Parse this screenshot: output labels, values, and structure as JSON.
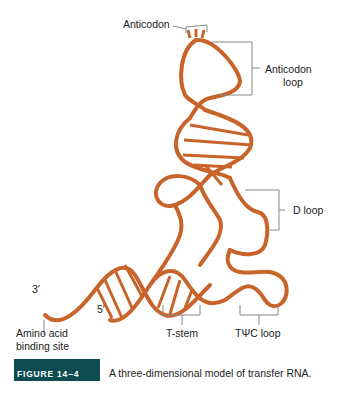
{
  "figure": {
    "title": "Three-dimensional model of transfer RNA",
    "strand_color": "#c8642a",
    "bracket_color": "#888888",
    "labels": {
      "anticodon": "Anticodon",
      "anticodon_loop_line1": "Anticodon",
      "anticodon_loop_line2": "loop",
      "d_loop": "D loop",
      "three_prime": "3′",
      "five_prime": "5′",
      "amino_line1": "Amino acid",
      "amino_line2": "binding site",
      "t_stem": "T-stem",
      "tpsic_loop": "TΨC loop"
    }
  },
  "caption": {
    "badge": "FIGURE 14–4",
    "badge_color": "#0f4c52",
    "text": "A three-dimensional model of transfer RNA."
  }
}
